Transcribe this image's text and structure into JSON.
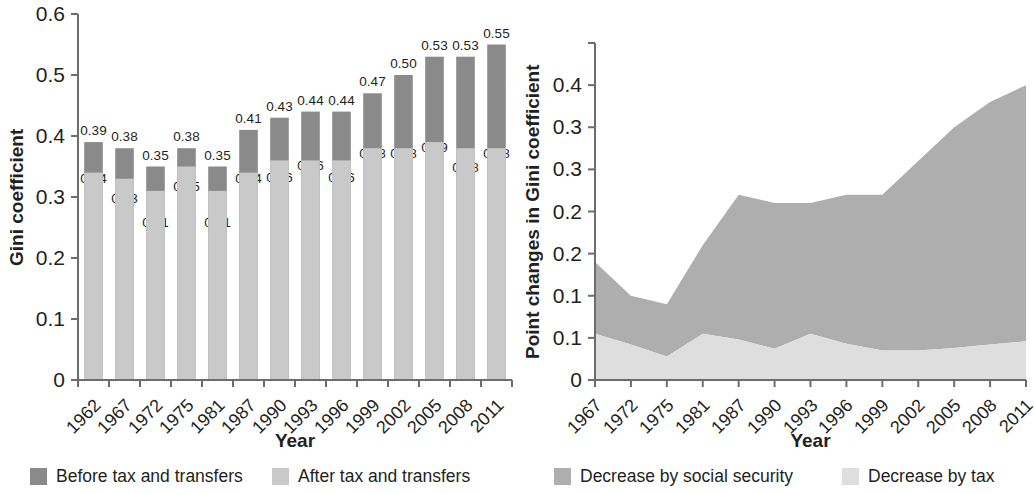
{
  "figure": {
    "background": "#ffffff",
    "text_color": "#231f20"
  },
  "colors": {
    "dark_gray": "#8a8a8a",
    "mid_gray": "#aeaeae",
    "light_gray": "#c9c9c9",
    "pale_gray": "#dedede",
    "axis": "#6d6d6d"
  },
  "left_panel": {
    "y_axis_title": "Gini coefficient",
    "x_axis_title": "Year",
    "y_ticks": [
      "0",
      "0.1",
      "0.2",
      "0.3",
      "0.4",
      "0.5",
      "0.6"
    ],
    "x_ticks": [
      "1962",
      "1967",
      "1972",
      "1975",
      "1981",
      "1987",
      "1990",
      "1993",
      "1996",
      "1999",
      "2002",
      "2005",
      "2008",
      "2011"
    ],
    "legend": [
      {
        "label": "Before tax and transfers",
        "swatch": "#8a8a8a",
        "icon": "legend-swatch-icon"
      },
      {
        "label": "After tax and transfers",
        "swatch": "#c9c9c9",
        "icon": "legend-swatch-icon"
      }
    ]
  },
  "right_panel": {
    "y_axis_title": "Point changes in Gini coefficient",
    "x_axis_title": "Year",
    "y_ticks": [
      "0",
      "0.1",
      "0.1",
      "0.2",
      "0.2",
      "0.3",
      "0.3",
      "0.4"
    ],
    "x_ticks": [
      "1967",
      "1972",
      "1975",
      "1981",
      "1987",
      "1990",
      "1993",
      "1996",
      "1999",
      "2002",
      "2005",
      "2008",
      "2011"
    ],
    "legend": [
      {
        "label": "Decrease by social security",
        "swatch": "#aeaeae",
        "icon": "legend-swatch-icon"
      },
      {
        "label": "Decrease by tax",
        "swatch": "#dedede",
        "icon": "legend-swatch-icon"
      }
    ]
  },
  "chart_data": [
    {
      "type": "bar",
      "id": "gini-before-after-bars",
      "title": "",
      "xlabel": "Year",
      "ylabel": "Gini coefficient",
      "ylim": [
        0,
        0.6
      ],
      "ytick_values": [
        0,
        0.1,
        0.2,
        0.3,
        0.4,
        0.5,
        0.6
      ],
      "ytick_labels": [
        "0",
        "0.1",
        "0.2",
        "0.3",
        "0.4",
        "0.5",
        "0.6"
      ],
      "grid": false,
      "stacked_overlay": true,
      "bar_label_precision": 2,
      "categories": [
        "1962",
        "1967",
        "1972",
        "1975",
        "1981",
        "1987",
        "1990",
        "1993",
        "1996",
        "1999",
        "2002",
        "2005",
        "2008",
        "2011"
      ],
      "series": [
        {
          "name": "Before tax and transfers",
          "color": "#8a8a8a",
          "values": [
            0.39,
            0.38,
            0.35,
            0.38,
            0.35,
            0.41,
            0.43,
            0.44,
            0.44,
            0.47,
            0.5,
            0.53,
            0.53,
            0.55
          ],
          "labels": [
            "0.39",
            "0.38",
            "0.35",
            "0.38",
            "0.35",
            "0.41",
            "0.43",
            "0.44",
            "0.44",
            "0.47",
            "0.50",
            "0.53",
            "0.53",
            "0.55"
          ]
        },
        {
          "name": "After tax and transfers",
          "color": "#c9c9c9",
          "values": [
            0.34,
            0.33,
            0.31,
            0.35,
            0.31,
            0.34,
            0.36,
            0.36,
            0.36,
            0.38,
            0.38,
            0.39,
            0.38,
            0.38
          ],
          "labels": [
            "0.34",
            "0.33",
            "0.31",
            "0.35",
            "0.31",
            "0.34",
            "0.36",
            "0.36",
            "0.36",
            "0.38",
            "0.38",
            "0.39",
            "0.38",
            "0.38"
          ]
        }
      ],
      "legend_position": "below"
    },
    {
      "type": "area",
      "id": "gini-point-changes-area",
      "title": "",
      "xlabel": "Year",
      "ylabel": "Point changes in Gini coefficient",
      "ylim": [
        0,
        0.4
      ],
      "ytick_values": [
        0,
        0.05,
        0.1,
        0.15,
        0.2,
        0.25,
        0.3,
        0.35,
        0.4
      ],
      "ytick_labels": [
        "0",
        "0.1",
        "0.1",
        "0.2",
        "0.2",
        "0.3",
        "0.3",
        "0.4"
      ],
      "grid": false,
      "stacked": true,
      "x": [
        "1967",
        "1972",
        "1975",
        "1981",
        "1987",
        "1990",
        "1993",
        "1996",
        "1999",
        "2002",
        "2005",
        "2008",
        "2011"
      ],
      "series": [
        {
          "name": "Decrease by tax",
          "color": "#dedede",
          "values": [
            0.055,
            0.042,
            0.028,
            0.055,
            0.048,
            0.037,
            0.055,
            0.043,
            0.035,
            0.035,
            0.038,
            0.042,
            0.046
          ]
        },
        {
          "name": "Decrease by social security",
          "color": "#aeaeae",
          "values": [
            0.085,
            0.058,
            0.062,
            0.105,
            0.172,
            0.173,
            0.155,
            0.177,
            0.185,
            0.225,
            0.262,
            0.288,
            0.304
          ]
        }
      ],
      "totals": [
        0.14,
        0.1,
        0.09,
        0.16,
        0.22,
        0.21,
        0.21,
        0.22,
        0.22,
        0.26,
        0.3,
        0.33,
        0.35
      ],
      "legend_position": "below"
    }
  ]
}
